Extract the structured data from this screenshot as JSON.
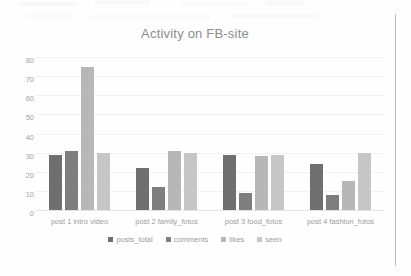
{
  "chart_data": {
    "type": "bar",
    "title": "Activity on FB-site",
    "xlabel": "",
    "ylabel": "",
    "ylim": [
      0,
      80
    ],
    "yticks": [
      80,
      70,
      60,
      50,
      40,
      30,
      20,
      10,
      0
    ],
    "grid": true,
    "legend_position": "bottom",
    "categories": [
      "post 1 intro video",
      "post 2 family_fotos",
      "post 3  food_fotos",
      "post 4 fashion_fotos"
    ],
    "series": [
      {
        "name": "posts_total",
        "color": "#6f6f6f",
        "values": [
          29,
          22,
          29,
          24
        ]
      },
      {
        "name": "comments",
        "color": "#7e7e7e",
        "values": [
          31,
          12,
          9,
          8
        ]
      },
      {
        "name": "likes",
        "color": "#b7b7b7",
        "values": [
          75,
          31,
          28,
          15
        ]
      },
      {
        "name": "seen",
        "color": "#c6c6c6",
        "values": [
          30,
          30,
          29,
          30
        ]
      }
    ]
  }
}
